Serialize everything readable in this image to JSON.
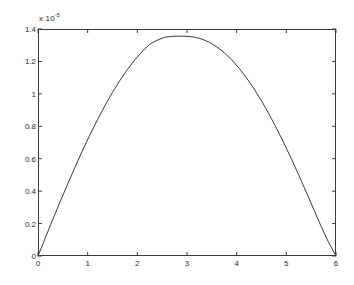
{
  "chart_data": {
    "type": "line",
    "title": "",
    "subtitle": "",
    "xlabel": "",
    "ylabel": "",
    "y_exponent_text": "x 10",
    "y_exponent_power": "-5",
    "y_exponent_full": "x 10^-5",
    "xlim": [
      0,
      6
    ],
    "ylim": [
      0,
      1.4
    ],
    "xticks": [
      0,
      1,
      2,
      3,
      4,
      5,
      6
    ],
    "xtick_labels": [
      "0",
      "1",
      "2",
      "3",
      "4",
      "5",
      "6"
    ],
    "yticks": [
      0,
      0.2,
      0.4,
      0.6,
      0.8,
      1,
      1.2,
      1.4
    ],
    "ytick_labels": [
      "0",
      "0.2",
      "0.4",
      "0.6",
      "0.8",
      "1",
      "1.2",
      "1.4"
    ],
    "grid": false,
    "legend": null,
    "legend_position": "none",
    "line_color": "#3a3a3a",
    "line_width": 1,
    "axis_color": "#3a3a3a",
    "background_color": "#ffffff",
    "tick_direction": "in",
    "box_on": true,
    "peak": {
      "x": 3,
      "y": 1.355
    },
    "series": [
      {
        "name": "curve",
        "x": [
          0,
          0.15,
          0.3,
          0.45,
          0.6,
          0.75,
          0.9,
          1.05,
          1.2,
          1.35,
          1.5,
          1.65,
          1.8,
          1.95,
          2.1,
          2.25,
          2.4,
          2.55,
          2.7,
          2.85,
          3,
          3.15,
          3.3,
          3.45,
          3.6,
          3.75,
          3.9,
          4.05,
          4.2,
          4.35,
          4.5,
          4.65,
          4.8,
          4.95,
          5.1,
          5.25,
          5.4,
          5.55,
          5.7,
          5.85,
          6
        ],
        "y": [
          0,
          0.114,
          0.227,
          0.338,
          0.446,
          0.551,
          0.653,
          0.75,
          0.842,
          0.929,
          1.009,
          1.083,
          1.15,
          1.21,
          1.262,
          1.306,
          1.331,
          1.349,
          1.355,
          1.356,
          1.355,
          1.35,
          1.338,
          1.318,
          1.29,
          1.254,
          1.21,
          1.158,
          1.098,
          1.031,
          0.957,
          0.876,
          0.789,
          0.697,
          0.6,
          0.499,
          0.395,
          0.289,
          0.183,
          0.085,
          0
        ]
      }
    ]
  }
}
